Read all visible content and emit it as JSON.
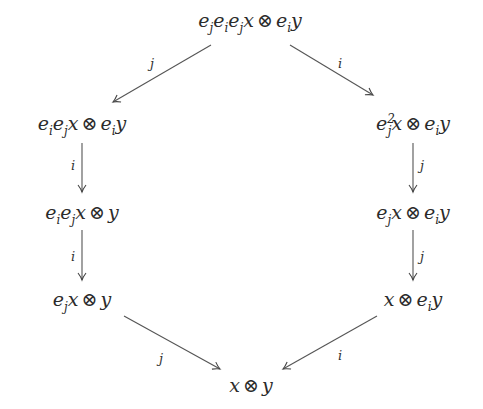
{
  "diagram": {
    "type": "commutative-hexagon",
    "nodes": {
      "top": {
        "parts": [
          "e",
          "j",
          "e",
          "i",
          "e",
          "j",
          "x",
          "⊗",
          "e",
          "i",
          "y"
        ],
        "text": "e_j e_i e_j x ⊗ e_i y"
      },
      "left1": {
        "text": "e_i e_j x ⊗ e_i y"
      },
      "left2": {
        "text": "e_i e_j x ⊗ y"
      },
      "left3": {
        "text": "e_j x ⊗ y"
      },
      "right1": {
        "text": "e_j^2 x ⊗ e_i y"
      },
      "right2": {
        "text": "e_j x ⊗ e_i y"
      },
      "right3": {
        "text": "x ⊗ e_i y"
      },
      "bottom": {
        "text": "x ⊗ y"
      }
    },
    "edges": [
      {
        "from": "top",
        "to": "left1",
        "label": "j"
      },
      {
        "from": "top",
        "to": "right1",
        "label": "i"
      },
      {
        "from": "left1",
        "to": "left2",
        "label": "i"
      },
      {
        "from": "left2",
        "to": "left3",
        "label": "i"
      },
      {
        "from": "right1",
        "to": "right2",
        "label": "j"
      },
      {
        "from": "right2",
        "to": "right3",
        "label": "j"
      },
      {
        "from": "left3",
        "to": "bottom",
        "label": "j"
      },
      {
        "from": "right3",
        "to": "bottom",
        "label": "i"
      }
    ],
    "symbols": {
      "tensor": "⊗"
    }
  }
}
